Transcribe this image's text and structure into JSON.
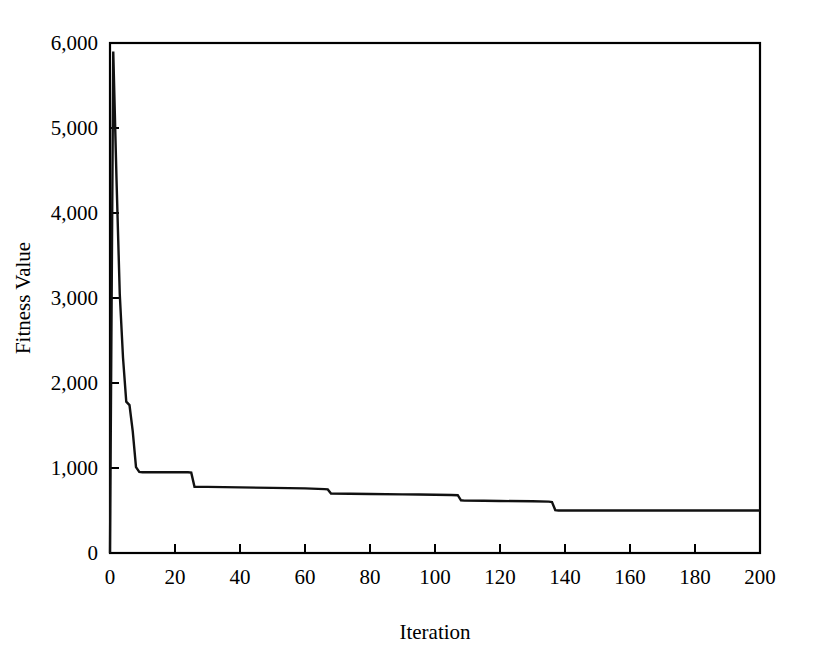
{
  "figure": {
    "background_color": "#ffffff",
    "line_color": "#111111",
    "axis_color": "#000000"
  },
  "chart_data": {
    "type": "line",
    "title": "",
    "subtitle": "",
    "xlabel": "Iteration",
    "ylabel": "Fitness Value",
    "xlim": [
      0,
      200
    ],
    "ylim": [
      0,
      6000
    ],
    "xticks": [
      0,
      20,
      40,
      60,
      80,
      100,
      120,
      140,
      160,
      180,
      200
    ],
    "xtick_labels": [
      "0",
      "20",
      "40",
      "60",
      "80",
      "100",
      "120",
      "140",
      "160",
      "180",
      "200"
    ],
    "yticks": [
      0,
      1000,
      2000,
      3000,
      4000,
      5000,
      6000
    ],
    "ytick_labels": [
      "0",
      "1,000",
      "2,000",
      "3,000",
      "4,000",
      "5,000",
      "6,000"
    ],
    "grid": false,
    "legend": null,
    "annotations": [],
    "series": [
      {
        "name": "Best fitness",
        "color": "#111111",
        "x": [
          0,
          1,
          2,
          3,
          4,
          5,
          6,
          7,
          8,
          9,
          10,
          12,
          15,
          20,
          24,
          25,
          26,
          30,
          40,
          50,
          60,
          66,
          67,
          68,
          80,
          90,
          95,
          100,
          105,
          107,
          108,
          109,
          115,
          120,
          130,
          135,
          136,
          137,
          138,
          145,
          160,
          180,
          200
        ],
        "y": [
          0,
          5900,
          4400,
          3050,
          2300,
          1780,
          1740,
          1430,
          1010,
          955,
          950,
          950,
          950,
          950,
          950,
          945,
          780,
          778,
          772,
          766,
          760,
          752,
          748,
          700,
          695,
          690,
          688,
          685,
          682,
          680,
          620,
          616,
          614,
          612,
          608,
          604,
          600,
          505,
          500,
          500,
          500,
          500,
          500
        ]
      }
    ]
  }
}
